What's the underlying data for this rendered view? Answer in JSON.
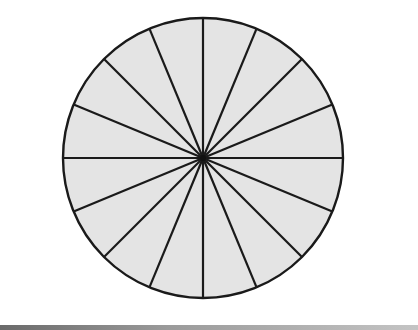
{
  "diagram": {
    "type": "divided-circle",
    "sector_count": 16,
    "sector_angle_degrees": 22.5,
    "center": {
      "x": 203,
      "y": 158
    },
    "radius": 140,
    "fill_color": "#e4e4e4",
    "stroke_color": "#1a1a1a",
    "stroke_width": 2.2
  },
  "page": {
    "background_color": "#ffffff",
    "bottom_rule_color": "#8a8a8a"
  }
}
